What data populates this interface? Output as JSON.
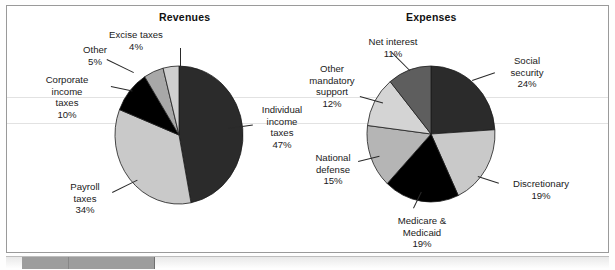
{
  "figure": {
    "background_color": "#ffffff",
    "frame_color": "#9a9a9a"
  },
  "charts": [
    {
      "id": "revenues",
      "title": "Revenues",
      "type": "pie"
    },
    {
      "id": "expenses",
      "title": "Expenses",
      "type": "pie"
    }
  ],
  "chart_data": [
    {
      "type": "pie",
      "title": "Revenues",
      "xlabel": "",
      "ylabel": "",
      "legend_position": "callout-labels",
      "grid": false,
      "categories": [
        "Individual income taxes",
        "Payroll taxes",
        "Corporate income taxes",
        "Other",
        "Excise taxes"
      ],
      "values": [
        47,
        34,
        10,
        5,
        4
      ],
      "value_unit": "%",
      "slice_colors": [
        "#2b2b2b",
        "#c9c9c9",
        "#000000",
        "#a8a8a8",
        "#cfcfcf"
      ],
      "start_angle_deg": -90,
      "direction": "clockwise",
      "labels": [
        {
          "name": "Individual income taxes",
          "lines": [
            "Individual",
            "income",
            "taxes",
            "47%"
          ],
          "value": "47%"
        },
        {
          "name": "Payroll taxes",
          "lines": [
            "Payroll",
            "taxes",
            "34%"
          ],
          "value": "34%"
        },
        {
          "name": "Corporate income taxes",
          "lines": [
            "Corporate",
            "income",
            "taxes",
            "10%"
          ],
          "value": "10%"
        },
        {
          "name": "Other",
          "lines": [
            "Other",
            "5%"
          ],
          "value": "5%"
        },
        {
          "name": "Excise taxes",
          "lines": [
            "Excise taxes",
            "4%"
          ],
          "value": "4%"
        }
      ]
    },
    {
      "type": "pie",
      "title": "Expenses",
      "xlabel": "",
      "ylabel": "",
      "legend_position": "callout-labels",
      "grid": false,
      "categories": [
        "Social security",
        "Discretionary",
        "Medicare & Medicaid",
        "National defense",
        "Other mandatory support",
        "Net interest"
      ],
      "values": [
        24,
        19,
        19,
        15,
        12,
        11
      ],
      "value_unit": "%",
      "slice_colors": [
        "#2b2b2b",
        "#c9c9c9",
        "#000000",
        "#b5b5b5",
        "#d4d4d4",
        "#5e5e5e"
      ],
      "start_angle_deg": -90,
      "direction": "clockwise",
      "labels": [
        {
          "name": "Social security",
          "lines": [
            "Social",
            "security",
            "24%"
          ],
          "value": "24%"
        },
        {
          "name": "Discretionary",
          "lines": [
            "Discretionary",
            "19%"
          ],
          "value": "19%"
        },
        {
          "name": "Medicare & Medicaid",
          "lines": [
            "Medicare &",
            "Medicaid",
            "19%"
          ],
          "value": "19%"
        },
        {
          "name": "National defense",
          "lines": [
            "National",
            "defense",
            "15%"
          ],
          "value": "15%"
        },
        {
          "name": "Other mandatory support",
          "lines": [
            "Other",
            "mandatory",
            "support",
            "12%"
          ],
          "value": "12%"
        },
        {
          "name": "Net interest",
          "lines": [
            "Net interest",
            "11%"
          ],
          "value": "11%"
        }
      ]
    }
  ],
  "labels": {
    "rev_individual_l1": "Individual",
    "rev_individual_l2": "income",
    "rev_individual_l3": "taxes",
    "rev_individual_l4": "47%",
    "rev_payroll_l1": "Payroll",
    "rev_payroll_l2": "taxes",
    "rev_payroll_l3": "34%",
    "rev_corporate_l1": "Corporate",
    "rev_corporate_l2": "income",
    "rev_corporate_l3": "taxes",
    "rev_corporate_l4": "10%",
    "rev_other_l1": "Other",
    "rev_other_l2": "5%",
    "rev_excise_l1": "Excise taxes",
    "rev_excise_l2": "4%",
    "exp_social_l1": "Social",
    "exp_social_l2": "security",
    "exp_social_l3": "24%",
    "exp_discretionary_l1": "Discretionary",
    "exp_discretionary_l2": "19%",
    "exp_medicare_l1": "Medicare &",
    "exp_medicare_l2": "Medicaid",
    "exp_medicare_l3": "19%",
    "exp_defense_l1": "National",
    "exp_defense_l2": "defense",
    "exp_defense_l3": "15%",
    "exp_othermand_l1": "Other",
    "exp_othermand_l2": "mandatory",
    "exp_othermand_l3": "support",
    "exp_othermand_l4": "12%",
    "exp_netinterest_l1": "Net interest",
    "exp_netinterest_l2": "11%"
  }
}
